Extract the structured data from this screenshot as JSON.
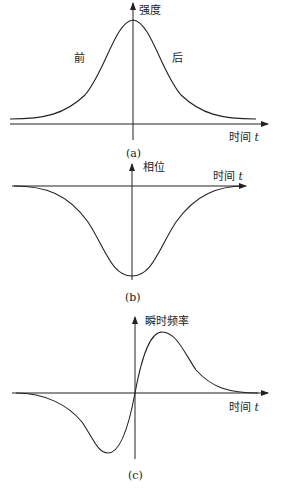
{
  "panels": [
    {
      "id": "a",
      "caption": "(a)",
      "y_label": "强度",
      "x_label": "时间",
      "x_var": "t",
      "annotations": {
        "left": "前",
        "right": "后"
      },
      "curve": "gaussian-intensity"
    },
    {
      "id": "b",
      "caption": "(b)",
      "y_label": "相位",
      "x_label": "时间",
      "x_var": "t",
      "curve": "inverted-gaussian-phase"
    },
    {
      "id": "c",
      "caption": "(c)",
      "y_label": "瞬时频率",
      "x_label": "时间",
      "x_var": "t",
      "curve": "derivative-of-gaussian-frequency"
    }
  ],
  "colors": {
    "line": "#222222",
    "background": "#ffffff"
  }
}
